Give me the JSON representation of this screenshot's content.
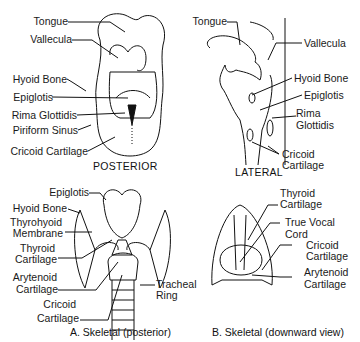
{
  "panels": {
    "posterior": {
      "title": "POSTERIOR",
      "labels": [
        "Tongue",
        "Vallecula",
        "Hyoid Bone",
        "Epiglotis",
        "Rima Glottidis",
        "Piriform Sinus",
        "Cricoid Cartilage"
      ]
    },
    "lateral": {
      "title": "LATERAL",
      "labels": [
        "Tongue",
        "Vallecula",
        "Hyoid Bone",
        "Epiglotis",
        "Rima",
        "Glottidis",
        "Cricoid",
        "Cartilage"
      ]
    },
    "skeletal_posterior": {
      "caption": "A. Skeletal (posterior)",
      "labels": [
        "Epiglotis",
        "Hyoid Bone",
        "Thyrohyoid",
        "Membrane",
        "Thyroid",
        "Cartilage",
        "Arytenoid",
        "Cartilage",
        "Cricoid",
        "Cartilage",
        "Tracheal",
        "Ring"
      ]
    },
    "skeletal_downward": {
      "caption": "B. Skeletal (downward view)",
      "labels": [
        "Thyroid",
        "Cartilage",
        "True Vocal",
        "Cord",
        "Cricoid",
        "Cartilage",
        "Arytenoid",
        "Cartilage"
      ]
    }
  }
}
